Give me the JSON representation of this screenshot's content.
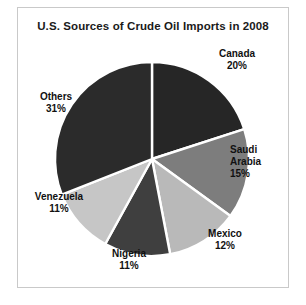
{
  "chart_data": {
    "type": "pie",
    "title": "U.S. Sources of Crude Oil Imports in 2008",
    "xlabel": "",
    "ylabel": "",
    "legend": "none",
    "grid": false,
    "start_angle_deg": 0,
    "direction": "clockwise",
    "categories": [
      "Canada",
      "Saudi Arabia",
      "Mexico",
      "Nigeria",
      "Venezuela",
      "Others"
    ],
    "values": [
      20,
      15,
      12,
      11,
      11,
      31
    ],
    "unit": "%",
    "total": 100,
    "slices": [
      {
        "label": "Canada",
        "value": 20,
        "value_text": "20%",
        "label_text": "Canada\n20%",
        "color": "#262626"
      },
      {
        "label": "Saudi Arabia",
        "value": 15,
        "value_text": "15%",
        "label_text": "Saudi\nArabia\n15%",
        "color": "#7d7d7d"
      },
      {
        "label": "Mexico",
        "value": 12,
        "value_text": "12%",
        "label_text": "Mexico\n12%",
        "color": "#b9b9b9"
      },
      {
        "label": "Nigeria",
        "value": 11,
        "value_text": "11%",
        "label_text": "Nigeria\n11%",
        "color": "#3f3f3f"
      },
      {
        "label": "Venezuela",
        "value": 11,
        "value_text": "11%",
        "label_text": "Venezuela\n11%",
        "color": "#c6c6c6"
      },
      {
        "label": "Others",
        "value": 31,
        "value_text": "31%",
        "label_text": "Others\n31%",
        "color": "#2b2b2b"
      }
    ]
  },
  "figure": {
    "border_color": "#c9c9c9",
    "background": "#ffffff",
    "separator_color": "#ffffff",
    "center_x": 134,
    "center_y": 151,
    "radius": 97
  }
}
